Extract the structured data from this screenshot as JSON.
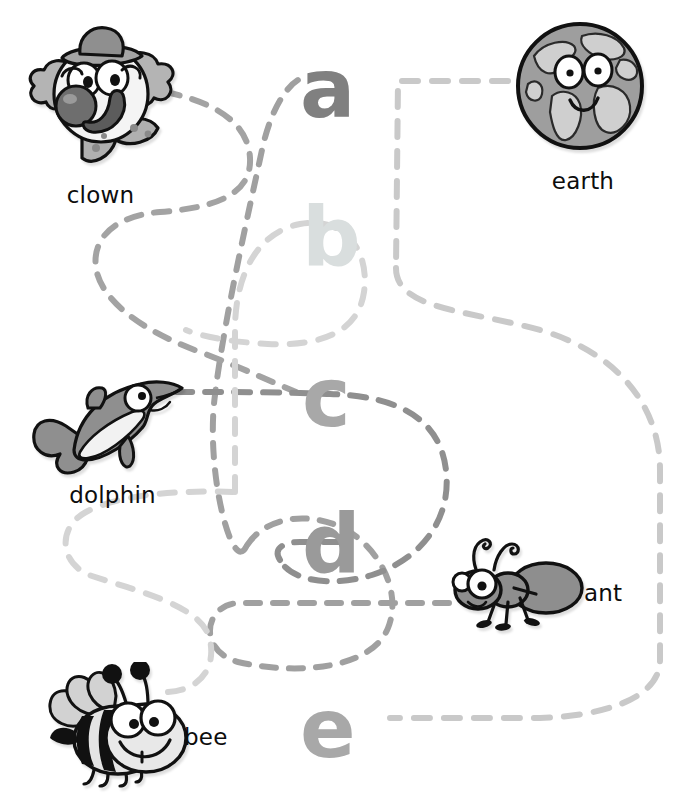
{
  "worksheet": {
    "type": "beginning-sound matching activity",
    "instruction_fragment": "",
    "page_background": "#ffffff"
  },
  "letters": [
    {
      "id": "a",
      "char": "a",
      "color": "#808080",
      "left": 300,
      "top": 48,
      "size": 82
    },
    {
      "id": "b",
      "char": "b",
      "color": "#d7dcdc",
      "left": 302,
      "top": 196,
      "size": 82
    },
    {
      "id": "c",
      "char": "c",
      "color": "#a8a8a8",
      "left": 302,
      "top": 357,
      "size": 82
    },
    {
      "id": "d",
      "char": "d",
      "color": "#9a9a9a",
      "left": 302,
      "top": 503,
      "size": 82
    },
    {
      "id": "e",
      "char": "e",
      "color": "#a8a8a8",
      "left": 300,
      "top": 688,
      "size": 82
    }
  ],
  "pictures": [
    {
      "id": "clown",
      "label": "clown",
      "icon": "clown-face-icon",
      "caption_position": "below"
    },
    {
      "id": "earth",
      "label": "earth",
      "icon": "earth-globe-icon",
      "caption_position": "below"
    },
    {
      "id": "dolphin",
      "label": "dolphin",
      "icon": "dolphin-icon",
      "caption_position": "below"
    },
    {
      "id": "ant",
      "label": "ant",
      "icon": "ant-icon",
      "caption_position": "right"
    },
    {
      "id": "bee",
      "label": "bee",
      "icon": "bee-icon",
      "caption_position": "right"
    }
  ],
  "connections": [
    {
      "from": "clown",
      "to": "c",
      "stroke": "#a9a9a9",
      "style": "dashed"
    },
    {
      "from": "earth",
      "to": "e",
      "stroke": "#c9c9c9",
      "style": "dashed"
    },
    {
      "from": "dolphin",
      "to": "d",
      "stroke": "#8f8f8f",
      "style": "dashed"
    },
    {
      "from": "ant",
      "to": "a",
      "stroke": "#a0a0a0",
      "style": "dashed"
    },
    {
      "from": "bee",
      "to": "b",
      "stroke": "#d2d2d2",
      "style": "dashed"
    }
  ],
  "palette": {
    "ink": "#1a1a1a",
    "mid_gray": "#8c8c8c",
    "light_gray": "#c8c8c8",
    "pale_gray": "#dcdcdc",
    "dash_dark": "#9a9a9a",
    "dash_light": "#cfcfcf"
  }
}
